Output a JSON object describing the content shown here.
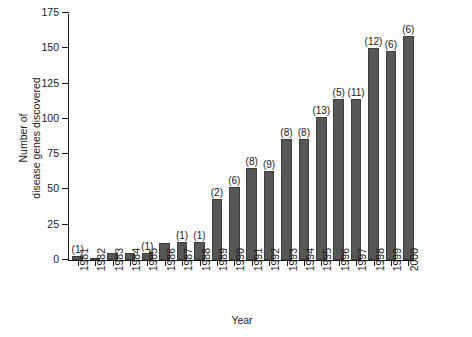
{
  "chart_data": {
    "type": "bar",
    "title": "",
    "xlabel": "Year",
    "ylabel_line1": "Number of",
    "ylabel_line2": "disease genes discovered",
    "ylabel": "Number of disease genes discovered",
    "ylim": [
      0,
      175
    ],
    "yticks": [
      0,
      25,
      50,
      75,
      100,
      125,
      150,
      175
    ],
    "ytick_labels": [
      "0",
      "25",
      "50",
      "75",
      "100",
      "125",
      "150",
      "175"
    ],
    "grid": false,
    "legend": "none",
    "bar_color": "#575757",
    "axis_color": "#1a1a1a",
    "categories": [
      "1981",
      "1982",
      "1983",
      "1984",
      "1985",
      "1986",
      "1987",
      "1988",
      "1989",
      "1990",
      "1991",
      "1992",
      "1993",
      "1994",
      "1995",
      "1996",
      "1997",
      "1998",
      "1999",
      "2000"
    ],
    "values": [
      3,
      1,
      5,
      5,
      5,
      12,
      13,
      13,
      43,
      52,
      65,
      63,
      86,
      86,
      101,
      114,
      114,
      150,
      148,
      159
    ],
    "annotations": [
      "(1)",
      "",
      "",
      "",
      "(1)",
      "",
      "(1)",
      "(1)",
      "(2)",
      "(6)",
      "(8)",
      "(9)",
      "(8)",
      "(8)",
      "(13)",
      "(5)",
      "(11)",
      "(12)",
      "(6)",
      "(6)"
    ]
  }
}
